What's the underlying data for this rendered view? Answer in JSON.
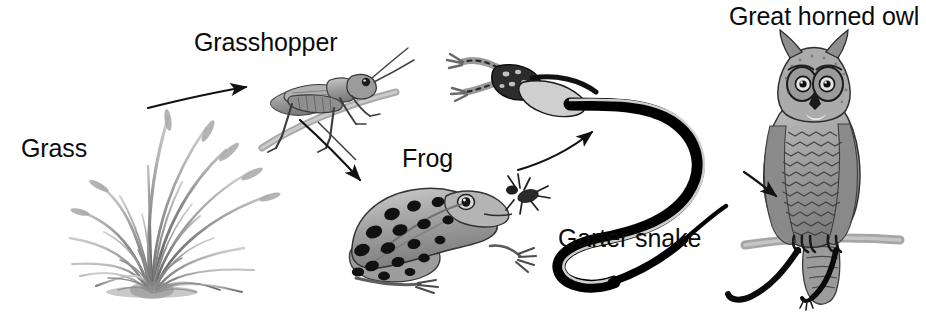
{
  "diagram": {
    "type": "food-chain",
    "background_color": "#ffffff",
    "width": 926,
    "height": 318,
    "text_color": "#0b0b0b",
    "ink_color": "#1a1a1a"
  },
  "labels": {
    "grass": "Grass",
    "grasshopper": "Grasshopper",
    "frog": "Frog",
    "garter_snake": "Garter snake",
    "owl": "Great horned owl"
  },
  "organisms": [
    {
      "id": "grass",
      "label": "Grass",
      "trophic_level": "producer",
      "icon": "grass-tuft-illustration"
    },
    {
      "id": "grasshopper",
      "label": "Grasshopper",
      "trophic_level": "primary-consumer",
      "icon": "grasshopper-illustration"
    },
    {
      "id": "frog",
      "label": "Frog",
      "trophic_level": "secondary-consumer",
      "icon": "frog-illustration"
    },
    {
      "id": "garter-snake",
      "label": "Garter snake",
      "trophic_level": "tertiary-consumer",
      "icon": "garter-snake-illustration"
    },
    {
      "id": "great-horned-owl",
      "label": "Great horned owl",
      "trophic_level": "apex-predator",
      "icon": "great-horned-owl-illustration"
    }
  ],
  "arrows": [
    {
      "id": "grass-to-grasshopper",
      "from": "grass",
      "to": "grasshopper"
    },
    {
      "id": "grasshopper-to-frog",
      "from": "grasshopper",
      "to": "frog"
    },
    {
      "id": "frog-to-garter-snake",
      "from": "frog",
      "to": "garter-snake"
    },
    {
      "id": "garter-snake-to-owl",
      "from": "garter-snake",
      "to": "great-horned-owl"
    }
  ]
}
